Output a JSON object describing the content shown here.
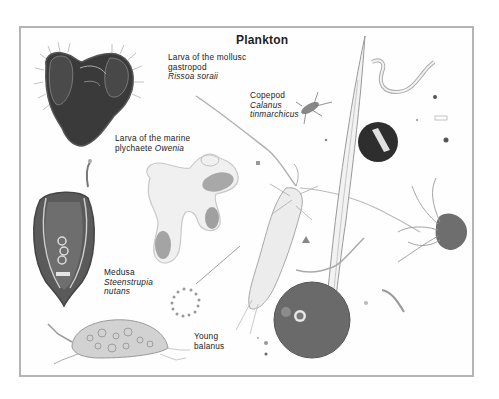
{
  "plate": {
    "title": "Plankton",
    "labels": {
      "gastropod": {
        "line1": "Larva of the mollusc",
        "line2": "gastropod",
        "species": "Rissoa soraii"
      },
      "polychaete": {
        "line1": "Larva of the marine",
        "line2_prefix": "plychaete ",
        "species": "Owenia"
      },
      "copepod": {
        "line1": "Copepod",
        "genus": "Calanus",
        "species": "tinmarchicus"
      },
      "medusa": {
        "line1": "Medusa",
        "genus": "Steenstrupia",
        "species": "nutans"
      },
      "balanus": {
        "line1": "Young",
        "line2": "balanus"
      }
    },
    "colors": {
      "frame": "#b4b4b4",
      "ink": "#222222",
      "dark_specimen": "#3a3a3a",
      "mid_specimen": "#7a7a7a",
      "light_specimen": "#c8c8c8"
    }
  }
}
